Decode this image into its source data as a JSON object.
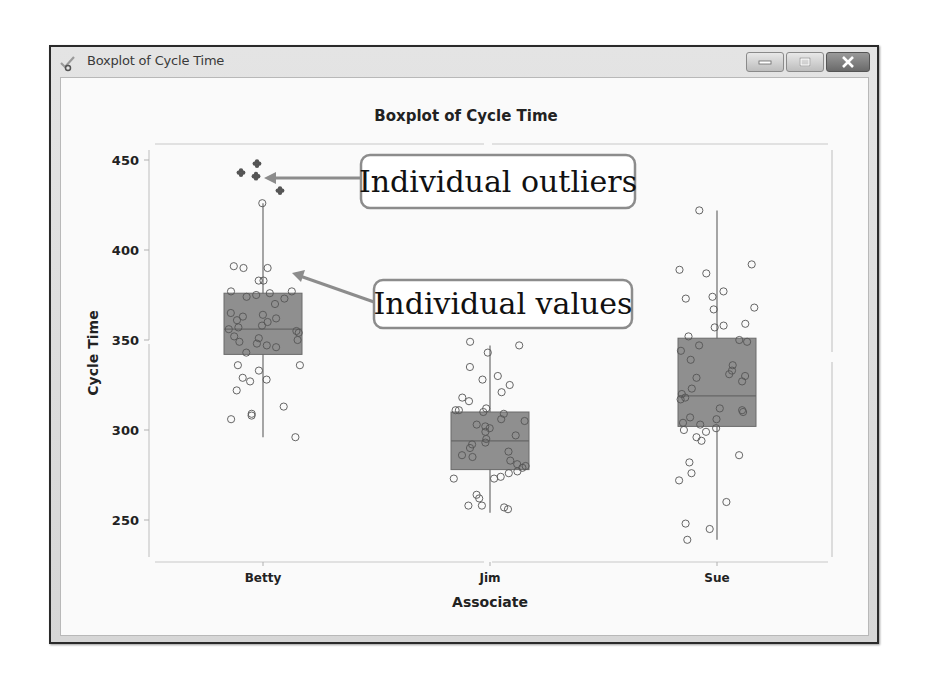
{
  "window": {
    "title": "Boxplot of Cycle Time",
    "buttons": {
      "minimize": "minimize",
      "maximize": "maximize",
      "close": "close"
    }
  },
  "colors": {
    "box_fill": "#8f8f8f",
    "box_stroke": "#6a6a6a",
    "point_stroke": "#555555",
    "outlier_fill": "#555555",
    "annotation_border": "#8c8c8c",
    "arrow": "#8c8c8c",
    "axis": "#c8c8c8"
  },
  "chart_data": {
    "type": "boxplot",
    "title": "Boxplot of Cycle Time",
    "xlabel": "Associate",
    "ylabel": "Cycle Time",
    "categories": [
      "Betty",
      "Jim",
      "Sue"
    ],
    "yticks": [
      250,
      300,
      350,
      400,
      450
    ],
    "ylim": [
      229,
      458
    ],
    "grid": false,
    "legend": null,
    "series": [
      {
        "name": "Betty",
        "q1": 342,
        "median": 356,
        "q3": 376,
        "whisker_low": 296,
        "whisker_high": 426,
        "outliers": [
          443,
          448,
          441,
          433
        ],
        "points": [
          426,
          390,
          391,
          390,
          383,
          383,
          377,
          377,
          376,
          375,
          374,
          373,
          370,
          365,
          364,
          363,
          362,
          361,
          360,
          358,
          357,
          356,
          355,
          354,
          352,
          351,
          350,
          349,
          348,
          347,
          346,
          343,
          336,
          336,
          333,
          329,
          328,
          327,
          322,
          313,
          309,
          308,
          306,
          296
        ]
      },
      {
        "name": "Jim",
        "q1": 278,
        "median": 294,
        "q3": 310,
        "whisker_low": 254,
        "whisker_high": 347,
        "outliers": [],
        "points": [
          349,
          347,
          343,
          335,
          330,
          328,
          325,
          321,
          318,
          316,
          312,
          311,
          311,
          310,
          309,
          306,
          305,
          303,
          302,
          301,
          299,
          297,
          295,
          293,
          292,
          290,
          288,
          286,
          285,
          283,
          281,
          280,
          279,
          277,
          276,
          274,
          273,
          273,
          264,
          262,
          258,
          258,
          257,
          256
        ]
      },
      {
        "name": "Sue",
        "q1": 302,
        "median": 319,
        "q3": 351,
        "whisker_low": 239,
        "whisker_high": 422,
        "outliers": [],
        "points": [
          422,
          392,
          389,
          387,
          377,
          374,
          373,
          368,
          367,
          359,
          358,
          357,
          352,
          350,
          349,
          347,
          344,
          339,
          336,
          333,
          331,
          330,
          329,
          327,
          323,
          320,
          318,
          317,
          312,
          311,
          310,
          307,
          306,
          304,
          303,
          301,
          300,
          299,
          296,
          294,
          286,
          282,
          276,
          272,
          260,
          248,
          245,
          239
        ]
      }
    ],
    "annotations": [
      {
        "text": "Individual outliers",
        "points_to": "Betty outliers"
      },
      {
        "text": "Individual values",
        "points_to": "Betty individual values"
      }
    ]
  }
}
